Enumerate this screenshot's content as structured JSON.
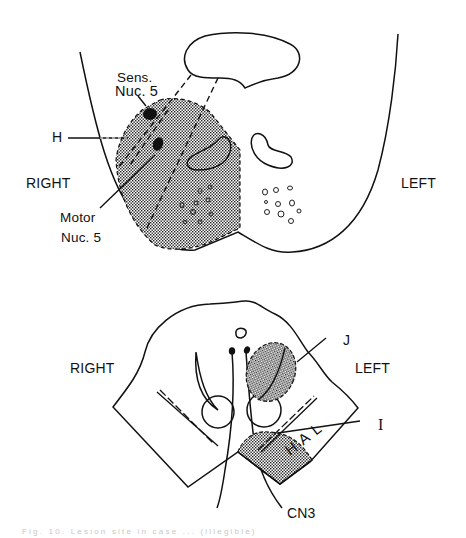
{
  "figure": {
    "top_panel": {
      "side_left_label": "RIGHT",
      "side_right_label": "LEFT",
      "annotations": {
        "sens_nuc_line1": "Sens.",
        "sens_nuc_line2": "Nuc. 5",
        "h_label": "H",
        "motor_nuc_line1": "Motor",
        "motor_nuc_line2": "Nuc. 5"
      }
    },
    "bottom_panel": {
      "side_left_label": "RIGHT",
      "side_right_label": "LEFT",
      "annotations": {
        "j_label": "J",
        "i_label": "I",
        "cn3_label": "CN3",
        "hal_label": "HAL"
      }
    },
    "caption": "Fig. 10. Lesion site in case ... (illegible)",
    "colors": {
      "ink": "#111111",
      "stipple": "#9a9a9a",
      "background": "#ffffff"
    }
  }
}
